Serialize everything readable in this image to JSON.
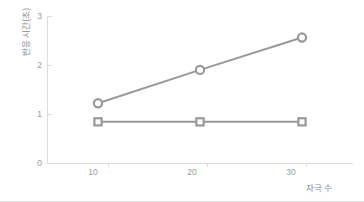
{
  "chart_data": {
    "type": "line",
    "title": "",
    "xlabel": "자극 수",
    "ylabel": "반응 시간(초)",
    "x": [
      10,
      20,
      30
    ],
    "xtick_labels": [
      "10",
      "20",
      "30"
    ],
    "ytick_labels": [
      "0",
      "1",
      "2",
      "3"
    ],
    "yticks": [
      0,
      1,
      2,
      3
    ],
    "xlim": [
      5,
      35
    ],
    "ylim": [
      0,
      3
    ],
    "grid": false,
    "legend": "none",
    "series": [
      {
        "name": "increasing-series",
        "marker": "circle",
        "color": "#999999",
        "values": [
          1.22,
          1.9,
          2.56
        ]
      },
      {
        "name": "flat-series",
        "marker": "square",
        "color": "#999999",
        "values": [
          0.84,
          0.84,
          0.84
        ]
      }
    ]
  },
  "style": {
    "line_color": "#999999",
    "axis_color": "#dcdcdc",
    "tick_text_color": "#9a9a9a",
    "label_text_color": "#8a8a8a",
    "background": "#ffffff"
  }
}
